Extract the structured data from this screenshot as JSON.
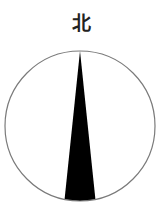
{
  "compass": {
    "north_label": "北",
    "circle_stroke": "#7a7a7a",
    "needle_fill": "#000000",
    "caption": ""
  }
}
